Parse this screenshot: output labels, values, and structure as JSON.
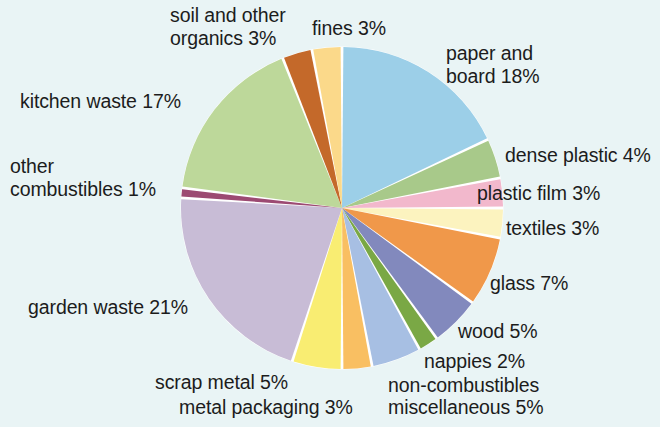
{
  "figure": {
    "background_color": "#e9f4f5",
    "text_color": "#1c1c1c",
    "center": {
      "x": 342,
      "y": 208
    },
    "radius": 161,
    "start_angle_deg": 0,
    "direction": "clockwise",
    "slice_gap_deg": 1.0,
    "gap_color": "#ffffff"
  },
  "chart_data": {
    "type": "pie",
    "title": "",
    "subtitle": "",
    "xlabel": "",
    "ylabel": "",
    "legend_position": "labels-around-pie",
    "grid": false,
    "units": "percent",
    "total": 100,
    "categories": [
      "paper and board",
      "dense plastic",
      "plastic film",
      "textiles",
      "glass",
      "wood",
      "nappies",
      "non-combustibles miscellaneous",
      "metal packaging",
      "scrap metal",
      "garden waste",
      "other combustibles",
      "kitchen waste",
      "soil and other organics",
      "fines"
    ],
    "values": [
      18,
      4,
      3,
      3,
      7,
      5,
      2,
      5,
      3,
      5,
      21,
      1,
      17,
      3,
      3
    ],
    "colors": [
      "#9ccfe8",
      "#a8c98a",
      "#f2b8cc",
      "#fcf3bf",
      "#f0984a",
      "#8289bd",
      "#7aa845",
      "#a7bfe3",
      "#f9bf62",
      "#f9ed72",
      "#c8bcd6",
      "#9c4a72",
      "#bdd89a",
      "#c4692a",
      "#fbd98a"
    ],
    "slices": [
      {
        "label": "paper and board",
        "value": 18,
        "display": "paper and board 18%",
        "color": "#9ccfe8"
      },
      {
        "label": "dense plastic",
        "value": 4,
        "display": "dense plastic 4%",
        "color": "#a8c98a"
      },
      {
        "label": "plastic film",
        "value": 3,
        "display": "plastic film 3%",
        "color": "#f2b8cc"
      },
      {
        "label": "textiles",
        "value": 3,
        "display": "textiles 3%",
        "color": "#fcf3bf"
      },
      {
        "label": "glass",
        "value": 7,
        "display": "glass 7%",
        "color": "#f0984a"
      },
      {
        "label": "wood",
        "value": 5,
        "display": "wood 5%",
        "color": "#8289bd"
      },
      {
        "label": "nappies",
        "value": 2,
        "display": "nappies 2%",
        "color": "#7aa845"
      },
      {
        "label": "non-combustibles miscellaneous",
        "value": 5,
        "display": "non-combustibles miscellaneous 5%",
        "color": "#a7bfe3"
      },
      {
        "label": "metal packaging",
        "value": 3,
        "display": "metal packaging 3%",
        "color": "#f9bf62"
      },
      {
        "label": "scrap metal",
        "value": 5,
        "display": "scrap metal 5%",
        "color": "#f9ed72"
      },
      {
        "label": "garden waste",
        "value": 21,
        "display": "garden waste 21%",
        "color": "#c8bcd6"
      },
      {
        "label": "other combustibles",
        "value": 1,
        "display": "other combustibles 1%",
        "color": "#9c4a72"
      },
      {
        "label": "kitchen waste",
        "value": 17,
        "display": "kitchen waste 17%",
        "color": "#bdd89a"
      },
      {
        "label": "soil and other organics",
        "value": 3,
        "display": "soil and other organics 3%",
        "color": "#c4692a"
      },
      {
        "label": "fines",
        "value": 3,
        "display": "fines 3%",
        "color": "#fbd98a"
      }
    ]
  },
  "labels": {
    "soil_and_other_organics_line1": "soil and other",
    "soil_and_other_organics_line2": "organics 3%",
    "fines": "fines 3%",
    "paper_and_board_line1": "paper and",
    "paper_and_board_line2": "board 18%",
    "kitchen_waste": "kitchen waste 17%",
    "dense_plastic": "dense plastic 4%",
    "plastic_film": "plastic film 3%",
    "other_combustibles_line1": "other",
    "other_combustibles_line2": "combustibles 1%",
    "textiles": "textiles 3%",
    "glass": "glass 7%",
    "garden_waste": "garden waste 21%",
    "wood": "wood 5%",
    "nappies": "nappies 2%",
    "scrap_metal": "scrap metal 5%",
    "non_combustibles_line1": "non-combustibles",
    "metal_packaging": "metal packaging 3%",
    "non_combustibles_line2": "miscellaneous 5%"
  }
}
